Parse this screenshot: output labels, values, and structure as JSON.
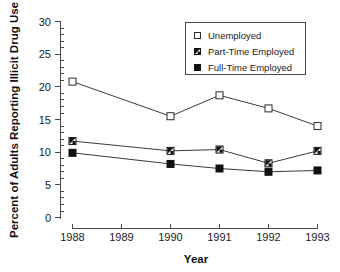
{
  "chart_data": {
    "type": "line",
    "title": "",
    "subtitle": "",
    "xlabel": "Year",
    "ylabel": "Percent  of  Adults  Reporting  Illicit  Drug  Use",
    "categories": [
      "1988",
      "1989",
      "1990",
      "1991",
      "1992",
      "1993"
    ],
    "x": [
      1988,
      1989,
      1990,
      1991,
      1992,
      1993
    ],
    "xlim": [
      1988,
      1993
    ],
    "ylim": [
      0,
      30
    ],
    "y_ticks": [
      "0",
      "5",
      "10",
      "15",
      "20",
      "25",
      "30"
    ],
    "y_tick_values": [
      0,
      5,
      10,
      15,
      20,
      25,
      30
    ],
    "y_minor_tick_step": 1,
    "grid": false,
    "legend_position": "top-right",
    "series": [
      {
        "name": "Unemployed",
        "marker": "open-square",
        "values": [
          20.8,
          null,
          15.5,
          18.7,
          16.7,
          14.0
        ]
      },
      {
        "name": "Part-Time Employed",
        "marker": "half-filled-square",
        "values": [
          11.7,
          null,
          10.2,
          10.4,
          8.3,
          10.2
        ]
      },
      {
        "name": "Full-Time Employed",
        "marker": "filled-square",
        "values": [
          9.9,
          null,
          8.2,
          7.5,
          7.0,
          7.2
        ]
      }
    ],
    "annotations": []
  },
  "legend": {
    "entries": [
      {
        "label": "Unemployed",
        "marker": "open-square"
      },
      {
        "label": "Part-Time Employed",
        "marker": "half-filled-square"
      },
      {
        "label": "Full-Time Employed",
        "marker": "filled-square"
      }
    ]
  },
  "colors": {
    "background": "#ffffff",
    "line": "#3b3b3b",
    "axis": "#4a4a4a",
    "text": "#1a1a1a",
    "marker_fill_dark": "#111111",
    "marker_fill_light": "#ffffff"
  }
}
